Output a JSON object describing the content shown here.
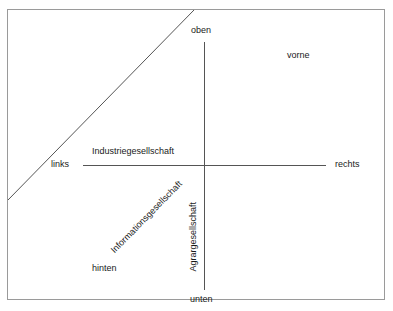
{
  "diagram": {
    "frame_color": "#9a9a9a",
    "line_color": "#555555",
    "text_color": "#1a1a1a",
    "background_color": "#ffffff",
    "axes": [
      {
        "id": "horizontal",
        "orientation": "horizontal",
        "negative_end_label": "links",
        "positive_end_label": "rechts",
        "axis_label": "Industriegesellschaft",
        "axis_label_rotation_deg": 0
      },
      {
        "id": "vertical",
        "orientation": "vertical",
        "negative_end_label": "unten",
        "positive_end_label": "oben",
        "axis_label": "Agrargesellschaft",
        "axis_label_rotation_deg": -90
      },
      {
        "id": "diagonal",
        "orientation": "diagonal",
        "negative_end_label": "hinten",
        "positive_end_label": "vorne",
        "axis_label": "Informationsgesellschaft",
        "axis_label_rotation_deg": -45.6
      }
    ],
    "labels": {
      "oben": "oben",
      "unten": "unten",
      "links": "links",
      "rechts": "rechts",
      "vorne": "vorne",
      "hinten": "hinten",
      "industriegesellschaft": "Industriegesellschaft",
      "agrargesellschaft": "Agrargesellschaft",
      "informationsgesellschaft": "Informationsgesellschaft"
    }
  }
}
